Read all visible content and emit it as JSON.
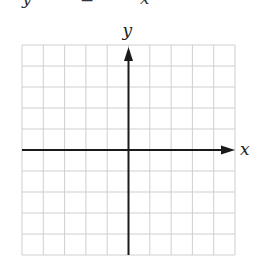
{
  "figure": {
    "type": "coordinate-grid",
    "top_clipped_text": [
      "y",
      "=",
      "x"
    ],
    "grid": {
      "columns": 10,
      "rows": 10,
      "left": 22,
      "top": 45,
      "right": 235,
      "bottom": 255,
      "line_color": "#cfcfcf"
    },
    "axes": {
      "origin_column": 5,
      "origin_row": 5,
      "color": "#1a1a1a",
      "x_label": "x",
      "y_label": "y"
    }
  }
}
